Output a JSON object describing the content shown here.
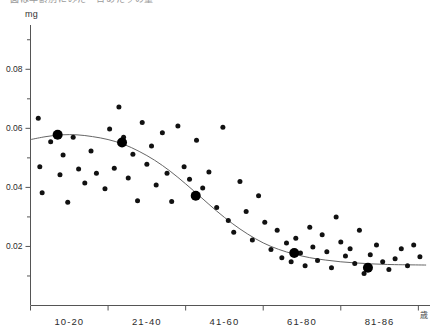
{
  "figure": {
    "top_caption_fragment": "図は年齢別にみた一日あたりの量",
    "y_axis_unit": "mg",
    "x_axis_unit": "歳"
  },
  "chart_data": {
    "type": "scatter",
    "title": "",
    "subtitle": "",
    "xlabel": "",
    "ylabel": "mg",
    "x_unit": "歳",
    "grid": false,
    "legend": "none",
    "categories": [
      "10-20",
      "21-40",
      "41-60",
      "61-80",
      "81-86"
    ],
    "category_tick_values": [
      0,
      1,
      2,
      3,
      4,
      5
    ],
    "xlim": [
      0,
      5.15
    ],
    "ylim": [
      0,
      0.095
    ],
    "y_ticks_major": [
      0.02,
      0.04,
      0.06,
      0.08
    ],
    "y_ticks_minor": [
      0.01,
      0.03,
      0.05,
      0.07,
      0.09
    ],
    "y_tick_labels": [
      "0.02",
      "0.04",
      "0.06",
      "0.08"
    ],
    "series": [
      {
        "name": "individual measurements",
        "marker": "small-filled-circle",
        "color": "#111111",
        "points": [
          [
            0.1,
            0.0634
          ],
          [
            0.12,
            0.047
          ],
          [
            0.15,
            0.0382
          ],
          [
            0.26,
            0.0555
          ],
          [
            0.38,
            0.0443
          ],
          [
            0.42,
            0.051
          ],
          [
            0.48,
            0.035
          ],
          [
            0.55,
            0.057
          ],
          [
            0.62,
            0.0462
          ],
          [
            0.7,
            0.0415
          ],
          [
            0.78,
            0.0523
          ],
          [
            0.85,
            0.0448
          ],
          [
            0.96,
            0.0395
          ],
          [
            1.02,
            0.0598
          ],
          [
            1.08,
            0.0465
          ],
          [
            1.14,
            0.0672
          ],
          [
            1.2,
            0.057
          ],
          [
            1.26,
            0.0432
          ],
          [
            1.32,
            0.0512
          ],
          [
            1.38,
            0.0355
          ],
          [
            1.44,
            0.062
          ],
          [
            1.5,
            0.0478
          ],
          [
            1.56,
            0.054
          ],
          [
            1.62,
            0.0408
          ],
          [
            1.7,
            0.0585
          ],
          [
            1.76,
            0.0448
          ],
          [
            1.82,
            0.0352
          ],
          [
            1.9,
            0.0608
          ],
          [
            1.98,
            0.047
          ],
          [
            2.05,
            0.0428
          ],
          [
            2.14,
            0.056
          ],
          [
            2.22,
            0.0398
          ],
          [
            2.3,
            0.0452
          ],
          [
            2.4,
            0.0332
          ],
          [
            2.48,
            0.0604
          ],
          [
            2.55,
            0.0288
          ],
          [
            2.62,
            0.0248
          ],
          [
            2.7,
            0.042
          ],
          [
            2.78,
            0.0318
          ],
          [
            2.86,
            0.0222
          ],
          [
            2.94,
            0.0372
          ],
          [
            3.02,
            0.0282
          ],
          [
            3.1,
            0.019
          ],
          [
            3.18,
            0.0255
          ],
          [
            3.24,
            0.0162
          ],
          [
            3.3,
            0.0212
          ],
          [
            3.36,
            0.0148
          ],
          [
            3.42,
            0.0228
          ],
          [
            3.48,
            0.0178
          ],
          [
            3.54,
            0.0135
          ],
          [
            3.6,
            0.0265
          ],
          [
            3.64,
            0.0198
          ],
          [
            3.7,
            0.0152
          ],
          [
            3.76,
            0.024
          ],
          [
            3.82,
            0.0182
          ],
          [
            3.88,
            0.0128
          ],
          [
            3.94,
            0.03
          ],
          [
            4.0,
            0.0215
          ],
          [
            4.06,
            0.0168
          ],
          [
            4.12,
            0.0192
          ],
          [
            4.18,
            0.0142
          ],
          [
            4.24,
            0.0255
          ],
          [
            4.3,
            0.0108
          ],
          [
            4.38,
            0.0172
          ],
          [
            4.46,
            0.0205
          ],
          [
            4.54,
            0.0148
          ],
          [
            4.62,
            0.0122
          ],
          [
            4.7,
            0.0158
          ],
          [
            4.78,
            0.0192
          ],
          [
            4.86,
            0.0135
          ],
          [
            4.94,
            0.0205
          ],
          [
            5.02,
            0.0165
          ]
        ]
      },
      {
        "name": "group means",
        "marker": "large-filled-circle",
        "color": "#000000",
        "points": [
          [
            0.35,
            0.0578
          ],
          [
            1.18,
            0.0552
          ],
          [
            2.13,
            0.0372
          ],
          [
            3.4,
            0.0178
          ],
          [
            4.35,
            0.0128
          ]
        ]
      }
    ],
    "fit_curve": {
      "name": "sigmoid trend line",
      "color": "#666666",
      "points": [
        [
          0.0,
          0.0562
        ],
        [
          0.2,
          0.0572
        ],
        [
          0.4,
          0.0578
        ],
        [
          0.6,
          0.0578
        ],
        [
          0.8,
          0.0572
        ],
        [
          1.0,
          0.0562
        ],
        [
          1.2,
          0.0546
        ],
        [
          1.4,
          0.0522
        ],
        [
          1.6,
          0.0492
        ],
        [
          1.8,
          0.0455
        ],
        [
          2.0,
          0.0412
        ],
        [
          2.2,
          0.0366
        ],
        [
          2.4,
          0.032
        ],
        [
          2.6,
          0.0278
        ],
        [
          2.8,
          0.0242
        ],
        [
          3.0,
          0.0212
        ],
        [
          3.2,
          0.019
        ],
        [
          3.4,
          0.0174
        ],
        [
          3.6,
          0.0162
        ],
        [
          3.8,
          0.0154
        ],
        [
          4.0,
          0.0148
        ],
        [
          4.2,
          0.0144
        ],
        [
          4.4,
          0.0141
        ],
        [
          4.6,
          0.0139
        ],
        [
          4.8,
          0.0138
        ],
        [
          5.1,
          0.0137
        ]
      ]
    }
  }
}
